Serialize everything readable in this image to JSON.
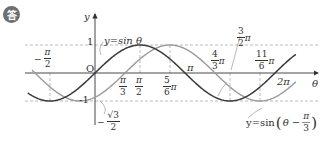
{
  "badge": {
    "label": "答"
  },
  "axes": {
    "x_label": "θ",
    "y_label": "y",
    "origin_label": "O",
    "y_max_label": "1",
    "y_min_label": "-1"
  },
  "curves": {
    "sin": {
      "label": "y=sin θ",
      "color": "#3a3a3a"
    },
    "shifted": {
      "label_prefix": "y=sin",
      "label_inner": "θ −",
      "frac_num": "π",
      "frac_den": "3",
      "color": "#9a9a9a"
    }
  },
  "ticks": {
    "neg_pi_half": {
      "sign": "−",
      "num": "π",
      "den": "2"
    },
    "pi_third": {
      "num": "π",
      "den": "3"
    },
    "pi_half": {
      "num": "π",
      "den": "2"
    },
    "five_sixth": {
      "num": "5",
      "den": "6",
      "suffix": "π"
    },
    "pi": {
      "text": "π"
    },
    "four_third": {
      "num": "4",
      "den": "3",
      "suffix": "π"
    },
    "three_half": {
      "num": "3",
      "den": "2",
      "suffix": "π"
    },
    "eleven_sixth": {
      "num": "11",
      "den": "6",
      "suffix": "π"
    },
    "two_pi": {
      "text": "2π"
    },
    "neg_sqrt3_half": {
      "sign": "−",
      "num": "√3",
      "den": "2"
    }
  },
  "chart_data": {
    "type": "line",
    "title": "",
    "xlabel": "θ",
    "ylabel": "y",
    "xlim": [
      -2.1,
      7.0
    ],
    "ylim": [
      -1,
      1
    ],
    "x_ticks": [
      "-π/2",
      "π/3",
      "π/2",
      "5π/6",
      "π",
      "4π/3",
      "3π/2",
      "11π/6",
      "2π"
    ],
    "y_ticks": [
      "1",
      "0",
      "-1",
      "-√3/2"
    ],
    "series": [
      {
        "name": "y=sin θ",
        "function": "sin(θ)",
        "points": [
          [
            -1.5708,
            -1
          ],
          [
            0,
            0
          ],
          [
            1.5708,
            1
          ],
          [
            3.1416,
            0
          ],
          [
            4.7124,
            -1
          ],
          [
            6.2832,
            0
          ]
        ]
      },
      {
        "name": "y=sin(θ − π/3)",
        "function": "sin(θ - π/3)",
        "points": [
          [
            -0.5236,
            -1
          ],
          [
            0,
            -0.866
          ],
          [
            1.0472,
            0
          ],
          [
            2.618,
            1
          ],
          [
            4.1888,
            0
          ],
          [
            5.7596,
            -1
          ],
          [
            7.3304,
            0
          ]
        ]
      }
    ],
    "guides": [
      "dashed y=1",
      "dashed y=-1",
      "dashed vertical at -π/2, π/2, 5π/6, 3π/2, 11π/6"
    ],
    "grid": false,
    "legend": "inline labels"
  }
}
